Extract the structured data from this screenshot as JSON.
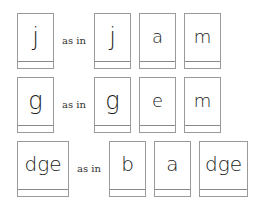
{
  "rows": [
    {
      "target": "j",
      "connector": "as in",
      "example": [
        "j",
        "a",
        "m"
      ]
    },
    {
      "target": "g",
      "connector": "as in",
      "example": [
        "g",
        "e",
        "m"
      ]
    },
    {
      "target": "dge",
      "connector": "as in",
      "example": [
        "b",
        "a",
        "dge"
      ]
    }
  ]
}
